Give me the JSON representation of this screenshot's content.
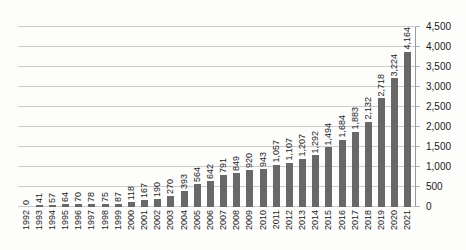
{
  "chart_data": {
    "type": "bar",
    "title": "",
    "xlabel": "",
    "ylabel": "",
    "categories": [
      "1992",
      "1993",
      "1994",
      "1995",
      "1996",
      "1997",
      "1998",
      "1999",
      "2000",
      "2001",
      "2002",
      "2003",
      "2004",
      "2005",
      "2006",
      "2007",
      "2008",
      "2009",
      "2010",
      "2011",
      "2012",
      "2013",
      "2014",
      "2015",
      "2016",
      "2017",
      "2018",
      "2019",
      "2020",
      "2021"
    ],
    "values": [
      0,
      41,
      57,
      64,
      70,
      78,
      75,
      87,
      118,
      167,
      190,
      270,
      393,
      564,
      642,
      791,
      849,
      920,
      943,
      1057,
      1107,
      1207,
      1292,
      1494,
      1684,
      1883,
      2132,
      2718,
      3224,
      4164
    ],
    "value_labels": [
      "0",
      "41",
      "57",
      "64",
      "70",
      "78",
      "75",
      "87",
      "118",
      "167",
      "190",
      "270",
      "393",
      "564",
      "642",
      "791",
      "849",
      "920",
      "943",
      "1,057",
      "1,107",
      "1,207",
      "1,292",
      "1,494",
      "1,684",
      "1,883",
      "2,132",
      "2,718",
      "3,224",
      "4,164"
    ],
    "ylim": [
      0,
      4500
    ],
    "y_ticks": [
      0,
      500,
      1000,
      1500,
      2000,
      2500,
      3000,
      3500,
      4000,
      4500
    ],
    "y_tick_labels": [
      "0",
      "500",
      "1,000",
      "1,500",
      "2,000",
      "2,500",
      "3,000",
      "3,500",
      "4,000",
      "4,500"
    ],
    "y_axis_position": "right",
    "grid": "horizontal",
    "legend": "none",
    "data_label_rotation": 90,
    "x_label_rotation": 90,
    "colors": {
      "bar": "#686868",
      "gridline": "#cccccc",
      "axis_line": "#9a9a9a",
      "text": "#1a1a1a",
      "background": "#fdfdfc"
    }
  }
}
